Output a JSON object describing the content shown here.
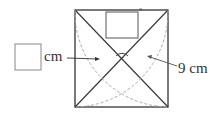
{
  "diagram": {
    "answer_box_unit": "cm",
    "side_label": "9 cm",
    "degree_mark": "°",
    "colors": {
      "line": "#333333",
      "dashed": "#aaaaaa",
      "box": "#888888"
    }
  }
}
